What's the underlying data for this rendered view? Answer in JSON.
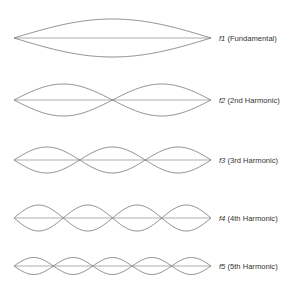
{
  "harmonics": [
    {
      "n": 1,
      "symbol": "f1",
      "name": "(Fundamental)"
    },
    {
      "n": 2,
      "symbol": "f2",
      "name": "(2nd Harmonic)"
    },
    {
      "n": 3,
      "symbol": "f3",
      "name": "(3rd Harmonic)"
    },
    {
      "n": 4,
      "symbol": "f4",
      "name": "(4th Harmonic)"
    },
    {
      "n": 5,
      "symbol": "f5",
      "name": "(5th Harmonic)"
    }
  ]
}
